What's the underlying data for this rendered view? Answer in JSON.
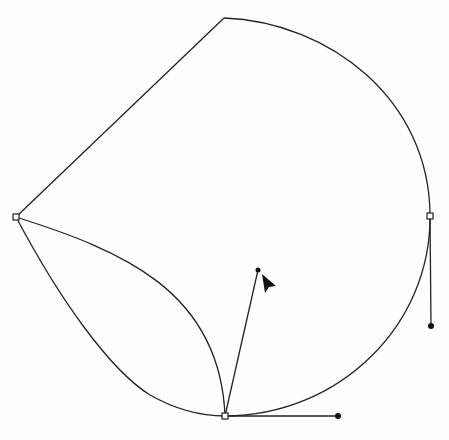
{
  "diagram": {
    "type": "bezier-path-editing",
    "colors": {
      "stroke": "#222222",
      "background": "#fefefe",
      "anchor_fill": "#ffffff"
    },
    "anchors": [
      {
        "id": "left",
        "x": 16,
        "y": 217
      },
      {
        "id": "bottom",
        "x": 225,
        "y": 416
      },
      {
        "id": "right",
        "x": 430,
        "y": 216
      }
    ],
    "corner_point": {
      "x": 224,
      "y": 18
    },
    "handles": [
      {
        "from": "bottom",
        "x": 338,
        "y": 416
      },
      {
        "from": "bottom",
        "x": 258,
        "y": 270
      },
      {
        "from": "right",
        "x": 431,
        "y": 326
      }
    ],
    "cursor": {
      "icon": "arrow-pointer-icon",
      "x": 262,
      "y": 276
    }
  }
}
